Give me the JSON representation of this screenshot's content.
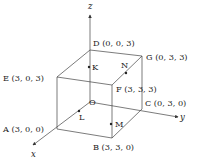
{
  "diagram": {
    "type": "3d-cube-coordinate-diagram",
    "colors": {
      "line": "#444444",
      "text": "#222222",
      "background": "#ffffff"
    },
    "axes": {
      "x": {
        "label": "x"
      },
      "y": {
        "label": "y"
      },
      "z": {
        "label": "z"
      }
    },
    "origin": {
      "name": "O"
    },
    "vertices": {
      "A": {
        "text": "A (3,  0,  0)"
      },
      "B": {
        "text": "B (3,  3,  0)"
      },
      "C": {
        "text": "C (0,  3,  0)"
      },
      "D": {
        "text": "D (0,  0,  3)"
      },
      "E": {
        "text": "E (3,  0,  3)"
      },
      "F": {
        "text": "F (3,  3,  3)"
      },
      "G": {
        "text": "G (0,  3,  3)"
      }
    },
    "points": {
      "K": {
        "text": "K"
      },
      "L": {
        "text": "L"
      },
      "M": {
        "text": "M"
      },
      "N": {
        "text": "N"
      }
    }
  }
}
